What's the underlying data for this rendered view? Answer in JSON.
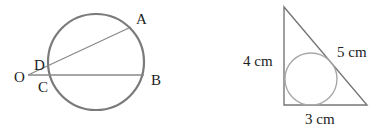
{
  "figure_left": {
    "description": "Circle with two secants from external point O",
    "points": {
      "A": "A",
      "B": "B",
      "C": "C",
      "D": "D",
      "O": "O"
    }
  },
  "figure_right": {
    "description": "Right triangle with inscribed circle",
    "side_labels": {
      "vertical": "4 cm",
      "hypotenuse": "5 cm",
      "base": "3 cm"
    }
  },
  "colors": {
    "circle_stroke": "#7a7a7a",
    "line_stroke": "#888888",
    "incircle_stroke": "#a8a8a8",
    "text": "#222222"
  }
}
